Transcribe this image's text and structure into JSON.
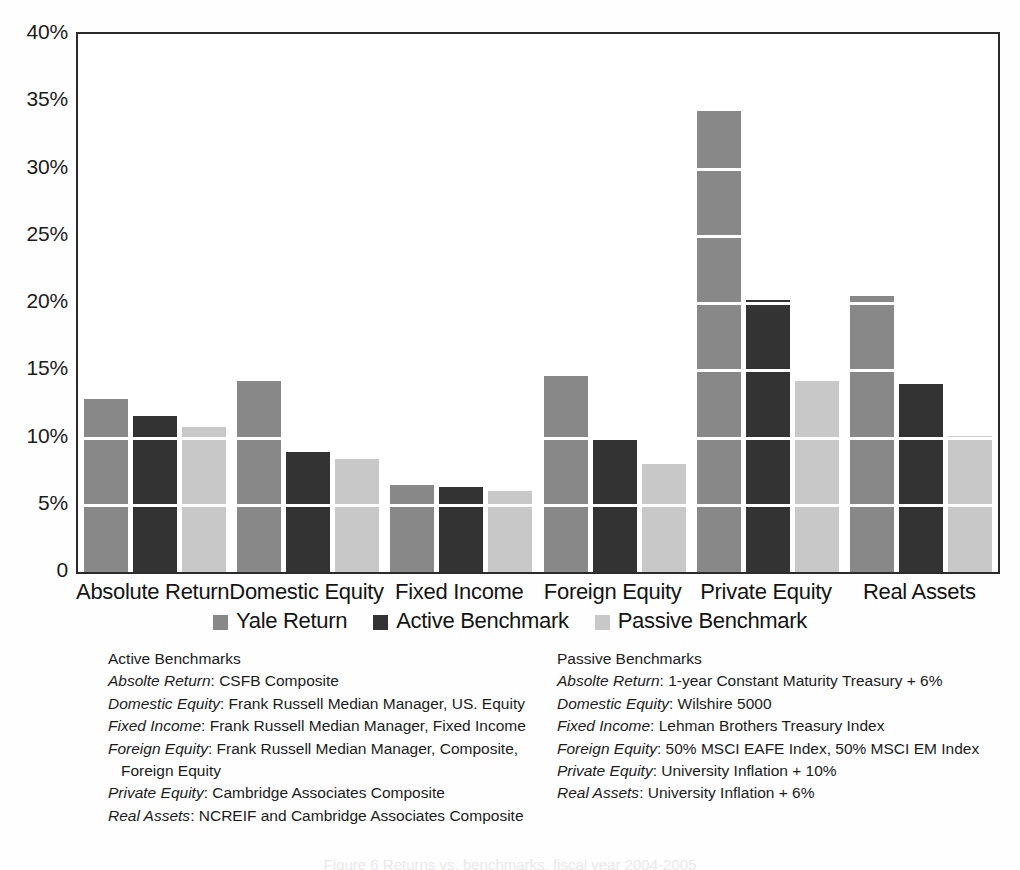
{
  "chart_data": {
    "type": "bar",
    "title": "",
    "xlabel": "",
    "ylabel": "",
    "ylim": [
      0,
      40
    ],
    "ytick_labels": [
      "40%",
      "35%",
      "30%",
      "25%",
      "20%",
      "15%",
      "10%",
      "5%",
      "0"
    ],
    "ytick_values": [
      40,
      35,
      30,
      25,
      20,
      15,
      10,
      5,
      0
    ],
    "grid": true,
    "legend_position": "bottom-center",
    "categories": [
      "Absolute Return",
      "Domestic Equity",
      "Fixed Income",
      "Foreign Equity",
      "Private Equity",
      "Real Assets"
    ],
    "series": [
      {
        "name": "Yale Return",
        "color": "#888888",
        "values": [
          12.9,
          14.2,
          6.5,
          14.6,
          34.3,
          20.5
        ]
      },
      {
        "name": "Active Benchmark",
        "color": "#333333",
        "values": [
          11.6,
          8.9,
          6.3,
          9.8,
          20.2,
          14.0
        ]
      },
      {
        "name": "Passive Benchmark",
        "color": "#c8c8c8",
        "values": [
          10.8,
          8.4,
          6.0,
          8.0,
          14.2,
          10.1
        ]
      }
    ]
  },
  "notes": {
    "left": {
      "heading": "Active Benchmarks",
      "rows": [
        {
          "category": "Absolte Return",
          "text": ": CSFB Composite",
          "continuation": ""
        },
        {
          "category": "Domestic Equity",
          "text": ": Frank Russell Median Manager, US. Equity",
          "continuation": ""
        },
        {
          "category": "Fixed Income",
          "text": ": Frank Russell Median Manager, Fixed Income",
          "continuation": ""
        },
        {
          "category": "Foreign Equity",
          "text": ": Frank Russell Median Manager, Composite,",
          "continuation": "Foreign Equity"
        },
        {
          "category": "Private Equity",
          "text": ": Cambridge Associates Composite",
          "continuation": ""
        },
        {
          "category": "Real Assets",
          "text": ": NCREIF and Cambridge Associates Composite",
          "continuation": ""
        }
      ]
    },
    "right": {
      "heading": "Passive Benchmarks",
      "rows": [
        {
          "category": "Absolte Return",
          "text": ": 1-year Constant Maturity Treasury + 6%",
          "continuation": ""
        },
        {
          "category": "Domestic Equity",
          "text": ": Wilshire 5000",
          "continuation": ""
        },
        {
          "category": "Fixed Income",
          "text": ": Lehman Brothers Treasury Index",
          "continuation": ""
        },
        {
          "category": "Foreign Equity",
          "text": ": 50% MSCI EAFE Index, 50% MSCI EM Index",
          "continuation": ""
        },
        {
          "category": "Private Equity",
          "text": ": University Inflation + 10%",
          "continuation": ""
        },
        {
          "category": "Real Assets",
          "text": ": University Inflation + 6%",
          "continuation": ""
        }
      ]
    }
  },
  "caption": "Figure 6 Returns vs. benchmarks, fiscal year 2004-2005"
}
